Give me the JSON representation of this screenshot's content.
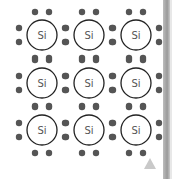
{
  "diagram": {
    "type": "silicon-crystal-lattice",
    "atom_label": "Si",
    "rows": 3,
    "cols": 3,
    "atoms": [
      {
        "label": "Si",
        "row": 0,
        "col": 0
      },
      {
        "label": "Si",
        "row": 0,
        "col": 1
      },
      {
        "label": "Si",
        "row": 0,
        "col": 2
      },
      {
        "label": "Si",
        "row": 1,
        "col": 0
      },
      {
        "label": "Si",
        "row": 1,
        "col": 1
      },
      {
        "label": "Si",
        "row": 1,
        "col": 2
      },
      {
        "label": "Si",
        "row": 2,
        "col": 0
      },
      {
        "label": "Si",
        "row": 2,
        "col": 1
      },
      {
        "label": "Si",
        "row": 2,
        "col": 2
      }
    ],
    "colors": {
      "electron": "#555555",
      "atom_outline": "#222222",
      "label": "#555555",
      "edge_bar": "#a8a8a8",
      "triangle": "#c9c9c9"
    }
  },
  "icons": {
    "corner_marker": "triangle-up-icon"
  }
}
